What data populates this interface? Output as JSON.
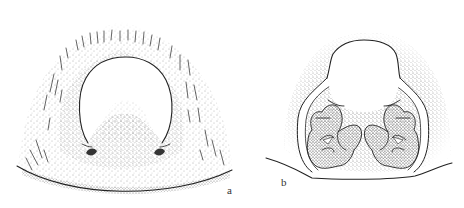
{
  "figure": {
    "panels": [
      {
        "id": "a",
        "label": "a",
        "description": "Stippled plate with central hood-shaped white area, two small dark notches at hood base, bristles along the upper margin, curved posterior margin"
      },
      {
        "id": "b",
        "label": "b",
        "description": "Hood-shaped white area flanked by lateral flanges, two clusters of coiled stippled lobes (spermathecae-like) below, curved posterior margin"
      }
    ],
    "style": {
      "ink_color": "#222222",
      "background": "#ffffff",
      "stipple_color": "#555555"
    }
  }
}
